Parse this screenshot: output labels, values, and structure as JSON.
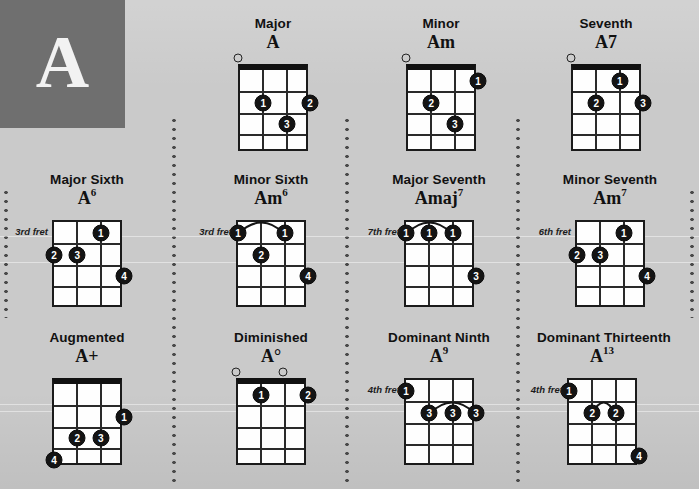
{
  "key": {
    "letter": "A",
    "box_color": "#6f6f6f"
  },
  "background_color": "#cacaca",
  "instrument": {
    "strings": 4,
    "frets": 4
  },
  "labels": {
    "fret_suffix": "fret"
  },
  "chords": [
    {
      "type": "Major",
      "name": "A",
      "sup": "",
      "nut": true,
      "start_fret_label": "",
      "open_strings": [
        1
      ],
      "dots": [
        {
          "finger": "1",
          "string": 2,
          "fret": 2
        },
        {
          "finger": "2",
          "string": 4,
          "fret": 2
        },
        {
          "finger": "3",
          "string": 3,
          "fret": 3
        }
      ],
      "barres": []
    },
    {
      "type": "Minor",
      "name": "Am",
      "sup": "",
      "nut": true,
      "start_fret_label": "",
      "open_strings": [
        1
      ],
      "dots": [
        {
          "finger": "1",
          "string": 4,
          "fret": 1
        },
        {
          "finger": "2",
          "string": 2,
          "fret": 2
        },
        {
          "finger": "3",
          "string": 3,
          "fret": 3
        }
      ],
      "barres": []
    },
    {
      "type": "Seventh",
      "name": "A7",
      "sup": "",
      "nut": true,
      "start_fret_label": "",
      "open_strings": [
        1
      ],
      "dots": [
        {
          "finger": "1",
          "string": 3,
          "fret": 1
        },
        {
          "finger": "2",
          "string": 2,
          "fret": 2
        },
        {
          "finger": "3",
          "string": 4,
          "fret": 2
        }
      ],
      "barres": []
    },
    {
      "type": "Major Sixth",
      "name": "A",
      "sup": "6",
      "nut": false,
      "start_fret_label": "3rd fret",
      "open_strings": [],
      "dots": [
        {
          "finger": "1",
          "string": 3,
          "fret": 1
        },
        {
          "finger": "2",
          "string": 1,
          "fret": 2
        },
        {
          "finger": "3",
          "string": 2,
          "fret": 2
        },
        {
          "finger": "4",
          "string": 4,
          "fret": 3
        }
      ],
      "barres": []
    },
    {
      "type": "Minor Sixth",
      "name": "Am",
      "sup": "6",
      "nut": false,
      "start_fret_label": "3rd fret",
      "open_strings": [],
      "dots": [
        {
          "finger": "1",
          "string": 1,
          "fret": 1
        },
        {
          "finger": "1",
          "string": 3,
          "fret": 1
        },
        {
          "finger": "2",
          "string": 2,
          "fret": 2
        },
        {
          "finger": "4",
          "string": 4,
          "fret": 3
        }
      ],
      "barres": [
        {
          "fret": 1,
          "from_string": 1,
          "to_string": 3
        }
      ]
    },
    {
      "type": "Major Seventh",
      "name": "Amaj",
      "sup": "7",
      "nut": false,
      "start_fret_label": "7th fret",
      "open_strings": [],
      "dots": [
        {
          "finger": "1",
          "string": 1,
          "fret": 1
        },
        {
          "finger": "1",
          "string": 2,
          "fret": 1
        },
        {
          "finger": "1",
          "string": 3,
          "fret": 1
        },
        {
          "finger": "3",
          "string": 4,
          "fret": 3
        }
      ],
      "barres": [
        {
          "fret": 1,
          "from_string": 1,
          "to_string": 3
        }
      ]
    },
    {
      "type": "Minor Seventh",
      "name": "Am",
      "sup": "7",
      "nut": false,
      "start_fret_label": "6th fret",
      "open_strings": [],
      "dots": [
        {
          "finger": "1",
          "string": 3,
          "fret": 1
        },
        {
          "finger": "2",
          "string": 1,
          "fret": 2
        },
        {
          "finger": "3",
          "string": 2,
          "fret": 2
        },
        {
          "finger": "4",
          "string": 4,
          "fret": 3
        }
      ],
      "barres": []
    },
    {
      "type": "Augmented",
      "name": "A+",
      "sup": "",
      "nut": true,
      "start_fret_label": "",
      "open_strings": [],
      "dots": [
        {
          "finger": "1",
          "string": 4,
          "fret": 2
        },
        {
          "finger": "2",
          "string": 2,
          "fret": 3
        },
        {
          "finger": "3",
          "string": 3,
          "fret": 3
        },
        {
          "finger": "4",
          "string": 1,
          "fret": 4
        }
      ],
      "barres": []
    },
    {
      "type": "Diminished",
      "name": "A°",
      "sup": "",
      "nut": true,
      "start_fret_label": "",
      "open_strings": [
        1,
        3
      ],
      "dots": [
        {
          "finger": "1",
          "string": 2,
          "fret": 1
        },
        {
          "finger": "2",
          "string": 4,
          "fret": 1
        }
      ],
      "barres": []
    },
    {
      "type": "Dominant Ninth",
      "name": "A",
      "sup": "9",
      "nut": false,
      "start_fret_label": "4th fret",
      "open_strings": [],
      "dots": [
        {
          "finger": "1",
          "string": 1,
          "fret": 1
        },
        {
          "finger": "3",
          "string": 2,
          "fret": 2
        },
        {
          "finger": "3",
          "string": 3,
          "fret": 2
        },
        {
          "finger": "3",
          "string": 4,
          "fret": 2
        }
      ],
      "barres": [
        {
          "fret": 2,
          "from_string": 2,
          "to_string": 4
        }
      ]
    },
    {
      "type": "Dominant Thirteenth",
      "name": "A",
      "sup": "13",
      "nut": false,
      "start_fret_label": "4th fret",
      "open_strings": [],
      "dots": [
        {
          "finger": "1",
          "string": 1,
          "fret": 1
        },
        {
          "finger": "2",
          "string": 2,
          "fret": 2
        },
        {
          "finger": "2",
          "string": 3,
          "fret": 2
        },
        {
          "finger": "4",
          "string": 4,
          "fret": 4
        }
      ],
      "barres": [
        {
          "fret": 2,
          "from_string": 2,
          "to_string": 3
        }
      ]
    }
  ],
  "layout": {
    "cells": [
      {
        "chord": 0,
        "left": 208,
        "top": 16,
        "grid_left": 238
      },
      {
        "chord": 1,
        "left": 376,
        "top": 16,
        "grid_left": 406
      },
      {
        "chord": 2,
        "left": 541,
        "top": 16,
        "grid_left": 571
      },
      {
        "chord": 3,
        "left": 22,
        "top": 172,
        "grid_left": 52
      },
      {
        "chord": 4,
        "left": 206,
        "top": 172,
        "grid_left": 236
      },
      {
        "chord": 5,
        "left": 374,
        "top": 172,
        "grid_left": 404
      },
      {
        "chord": 6,
        "left": 545,
        "top": 172,
        "grid_left": 575
      },
      {
        "chord": 7,
        "left": 22,
        "top": 330,
        "grid_left": 52
      },
      {
        "chord": 8,
        "left": 206,
        "top": 330,
        "grid_left": 236
      },
      {
        "chord": 9,
        "left": 374,
        "top": 330,
        "grid_left": 404
      },
      {
        "chord": 10,
        "left": 537,
        "top": 330,
        "grid_left": 567
      }
    ],
    "dividers": [
      {
        "left": 172,
        "top": 116,
        "height": 72
      },
      {
        "left": 345,
        "top": 116,
        "height": 72
      },
      {
        "left": 516,
        "top": 116,
        "height": 72
      },
      {
        "left": 4,
        "top": 188,
        "height": 130
      },
      {
        "left": 172,
        "top": 188,
        "height": 300
      },
      {
        "left": 345,
        "top": 188,
        "height": 300
      },
      {
        "left": 516,
        "top": 188,
        "height": 300
      },
      {
        "left": 690,
        "top": 188,
        "height": 130
      }
    ],
    "scanlines": [
      236,
      262,
      404,
      411
    ]
  }
}
